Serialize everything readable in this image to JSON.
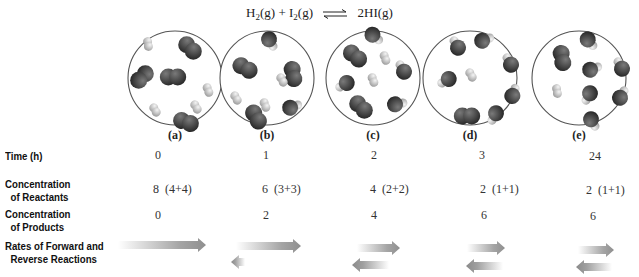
{
  "equation": {
    "reactant1": "H",
    "reactant1_sub": "2",
    "reactant1_state": "(g)",
    "plus": "+",
    "reactant2": "I",
    "reactant2_sub": "2",
    "reactant2_state": "(g)",
    "arrow_icon": "equilibrium-arrows",
    "product": "2HI(g)"
  },
  "flasks": [
    {
      "label": "(a)",
      "cx": 175,
      "i2": [
        [
          142,
          77,
          135
        ],
        [
          190,
          48,
          45
        ],
        [
          173,
          77,
          0
        ],
        [
          186,
          122,
          20
        ]
      ],
      "h2": [
        [
          148,
          44,
          80
        ],
        [
          208,
          90,
          70
        ],
        [
          155,
          110,
          60
        ],
        [
          196,
          107,
          60
        ]
      ],
      "hi": []
    },
    {
      "label": "(b)",
      "cx": 267,
      "i2": [
        [
          245,
          68,
          30
        ],
        [
          293,
          74,
          80
        ],
        [
          256,
          117,
          60
        ]
      ],
      "h2": [
        [
          282,
          80,
          60
        ],
        [
          236,
          98,
          60
        ],
        [
          265,
          105,
          70
        ]
      ],
      "hi": [
        [
          270,
          41,
          -120
        ],
        [
          292,
          107,
          160
        ]
      ]
    },
    {
      "label": "(c)",
      "cx": 373,
      "i2": [
        [
          355,
          56,
          40
        ],
        [
          361,
          107,
          45
        ]
      ],
      "h2": [
        [
          385,
          58,
          70
        ],
        [
          373,
          80,
          70
        ]
      ],
      "hi": [
        [
          374,
          36,
          -140
        ],
        [
          403,
          70,
          60
        ],
        [
          345,
          84,
          -30
        ],
        [
          397,
          104,
          170
        ]
      ]
    },
    {
      "label": "(d)",
      "cx": 470,
      "i2": [
        [
          467,
          116,
          0
        ]
      ],
      "h2": [
        [
          471,
          75,
          60
        ]
      ],
      "hi": [
        [
          457,
          46,
          60
        ],
        [
          484,
          40,
          160
        ],
        [
          510,
          63,
          60
        ],
        [
          447,
          80,
          -30
        ],
        [
          513,
          94,
          110
        ],
        [
          495,
          115,
          -60
        ]
      ]
    },
    {
      "label": "(e)",
      "cx": 579,
      "i2": [
        [
          562,
          58,
          80
        ]
      ],
      "h2": [
        [
          557,
          91,
          80
        ]
      ],
      "hi": [
        [
          589,
          41,
          -130
        ],
        [
          592,
          69,
          160
        ],
        [
          621,
          67,
          60
        ],
        [
          589,
          95,
          -60
        ],
        [
          621,
          96,
          120
        ],
        [
          592,
          121,
          -120
        ]
      ]
    }
  ],
  "rows": {
    "time": {
      "label": "Time (h)",
      "values": [
        "0",
        "1",
        "2",
        "3",
        "24"
      ]
    },
    "reactants": {
      "label_line1": "Concentration",
      "label_line2": "of Reactants",
      "values": [
        "8  (4+4)",
        "6  (3+3)",
        "4  (2+2)",
        "2  (1+1)",
        "2  (1+1)"
      ]
    },
    "products": {
      "label_line1": "Concentration",
      "label_line2": "of Products",
      "values": [
        "0",
        "2",
        "4",
        "6",
        "6"
      ]
    },
    "rates": {
      "label_line1": "Rates of Forward and",
      "label_line2": "Reverse Reactions",
      "forward_icon": "forward-rate-arrow",
      "reverse_icon": "reverse-rate-arrow",
      "arrows": [
        {
          "forward": [
            118,
            206,
            245
          ],
          "reverse": null
        },
        {
          "forward": [
            236,
            301,
            246
          ],
          "reverse": [
            231,
            245,
            262
          ]
        },
        {
          "forward": [
            357,
            400,
            248
          ],
          "reverse": [
            352,
            389,
            265
          ]
        },
        {
          "forward": [
            467,
            505,
            248
          ],
          "reverse": [
            466,
            503,
            266
          ]
        },
        {
          "forward": [
            578,
            614,
            250
          ],
          "reverse": [
            576,
            612,
            267
          ]
        }
      ]
    }
  },
  "colors": {
    "iodine": "#3a3a3a",
    "hydrogen": "#d9d9d9",
    "arrow": "#9a9a9a",
    "circle": "#555555"
  }
}
